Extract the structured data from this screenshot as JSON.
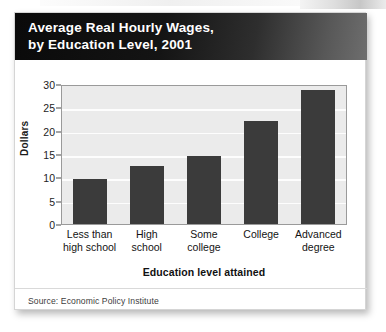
{
  "card": {
    "title_line1": "Average Real Hourly Wages,",
    "title_line2": "by Education Level, 2001",
    "source": "Source: Economic Policy Institute"
  },
  "colors": {
    "header_start": "#0a0a0a",
    "header_end": "#6e6e6e",
    "bar": "#3b3b3b",
    "plot_background": "#ebebeb",
    "gridline": "#fdfdfd",
    "axis": "#9a9a9a"
  },
  "chart_data": {
    "type": "bar",
    "title": "Average Real Hourly Wages, by Education Level, 2001",
    "subtitle": "",
    "categories": [
      "Less than high school",
      "High school",
      "Some college",
      "College",
      "Advanced degree"
    ],
    "category_lines": [
      [
        "Less than",
        "high school"
      ],
      [
        "High",
        "school"
      ],
      [
        "Some",
        "college"
      ],
      [
        "College",
        ""
      ],
      [
        "Advanced",
        "degree"
      ]
    ],
    "values": [
      9.6,
      12.5,
      14.5,
      22.0,
      28.8
    ],
    "xlabel": "Education level attained",
    "ylabel": "Dollars",
    "ylim": [
      0,
      30
    ],
    "yticks": [
      0,
      5,
      10,
      15,
      20,
      25,
      30
    ],
    "ytick_labels": [
      "0",
      "5",
      "10",
      "15",
      "20",
      "25",
      "30"
    ],
    "grid": true,
    "grid_axis": "y",
    "legend": false,
    "legend_position": "none",
    "source": "Source: Economic Policy Institute"
  }
}
